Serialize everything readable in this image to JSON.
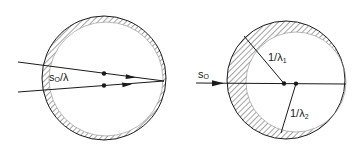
{
  "figure": {
    "left_panel": {
      "label": "s",
      "label_sub": "O",
      "label_suffix": "/λ",
      "description": "Ewald sphere shell for polychromatic beam; two incident directions converging at sphere surface"
    },
    "right_panel": {
      "beam_label": "s",
      "beam_label_sub": "O",
      "radius1_label": "1/λ",
      "radius1_sub": "1",
      "radius2_label": "1/λ",
      "radius2_sub": "2",
      "description": "Ewald spheres with radii 1/λ1 and 1/λ2, offset centers along incident beam"
    },
    "colors": {
      "line": "#1a1a1a",
      "hatch": "#555555",
      "background": "#ffffff"
    }
  }
}
